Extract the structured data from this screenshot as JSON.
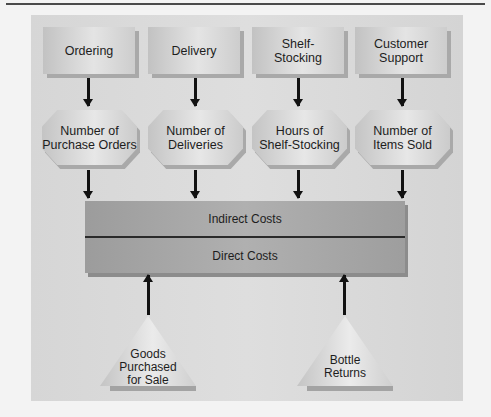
{
  "diagram": {
    "activities": [
      {
        "label": "Ordering"
      },
      {
        "label": "Delivery"
      },
      {
        "label": "Shelf-\nStocking"
      },
      {
        "label": "Customer\nSupport"
      }
    ],
    "cost_drivers": [
      {
        "label": "Number of\nPurchase Orders"
      },
      {
        "label": "Number of\nDeliveries"
      },
      {
        "label": "Hours of\nShelf-Stocking"
      },
      {
        "label": "Number of\nItems Sold"
      }
    ],
    "costs": {
      "indirect": "Indirect Costs",
      "direct": "Direct Costs"
    },
    "direct_inputs": [
      {
        "label": "Goods\nPurchased\nfor Sale"
      },
      {
        "label": "Bottle\nReturns"
      }
    ]
  },
  "colors": {
    "background": "#f3f3f3",
    "panel": "#d8d8d8",
    "cost_bar": "#a6a6a6",
    "arrow": "#111111"
  }
}
